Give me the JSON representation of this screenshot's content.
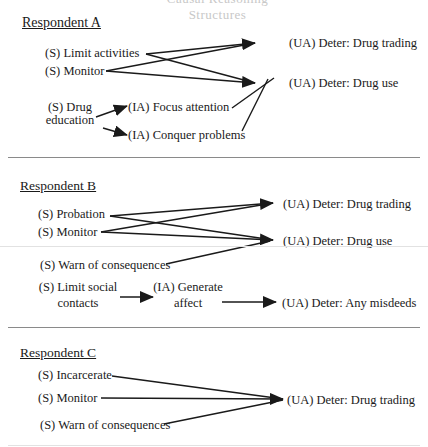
{
  "title_fragment": "Causal Reasoning Structures",
  "respondents": [
    {
      "heading": "Respondent A",
      "sanctions": [
        "(S) Limit activities",
        "(S) Monitor",
        "(S) Drug",
        "education"
      ],
      "intermediate": [
        "(IA) Focus attention",
        "(IA) Conquer problems"
      ],
      "outcomes": [
        "(UA) Deter: Drug trading",
        "(UA)  Deter: Drug use"
      ],
      "edges": [
        [
          "(S) Limit activities",
          "(UA) Deter: Drug trading"
        ],
        [
          "(S) Limit activities",
          "(UA) Deter: Drug use"
        ],
        [
          "(S) Monitor",
          "(UA) Deter: Drug trading"
        ],
        [
          "(S) Monitor",
          "(UA) Deter: Drug use"
        ],
        [
          "(S) Drug education",
          "(IA) Focus attention"
        ],
        [
          "(S) Drug education",
          "(IA) Conquer problems"
        ],
        [
          "(IA) Focus attention",
          "(UA) Deter: Drug use"
        ],
        [
          "(IA) Conquer problems",
          "(UA) Deter: Drug use"
        ]
      ]
    },
    {
      "heading": "Respondent B",
      "sanctions": [
        "(S) Probation",
        "(S) Monitor",
        "(S) Warn of consequences",
        "(S) Limit social",
        "contacts"
      ],
      "intermediate": [
        "(IA) Generate",
        "affect"
      ],
      "outcomes": [
        "(UA) Deter: Drug trading",
        "(UA)  Deter: Drug use",
        "(UA) Deter: Any misdeeds"
      ],
      "edges": [
        [
          "(S) Probation",
          "(UA) Deter: Drug trading"
        ],
        [
          "(S) Probation",
          "(UA) Deter: Drug use"
        ],
        [
          "(S) Monitor",
          "(UA) Deter: Drug trading"
        ],
        [
          "(S) Monitor",
          "(UA) Deter: Drug use"
        ],
        [
          "(S) Warn of consequences",
          "(UA) Deter: Drug use"
        ],
        [
          "(S) Limit social contacts",
          "(IA) Generate affect"
        ],
        [
          "(IA) Generate affect",
          "(UA) Deter: Any misdeeds"
        ]
      ]
    },
    {
      "heading": "Respondent C",
      "sanctions": [
        "(S) Incarcerate",
        "(S) Monitor",
        "(S) Warn of consequences"
      ],
      "outcomes": [
        "(UA) Deter: Drug trading"
      ],
      "edges": [
        [
          "(S) Incarcerate",
          "(UA) Deter: Drug trading"
        ],
        [
          "(S) Monitor",
          "(UA) Deter: Drug trading"
        ],
        [
          "(S) Warn of consequences",
          "(UA) Deter: Drug trading"
        ]
      ]
    }
  ],
  "colors": {
    "ink": "#1a1a1a",
    "divider": "#8a8a8a",
    "background": "#ffffff"
  }
}
